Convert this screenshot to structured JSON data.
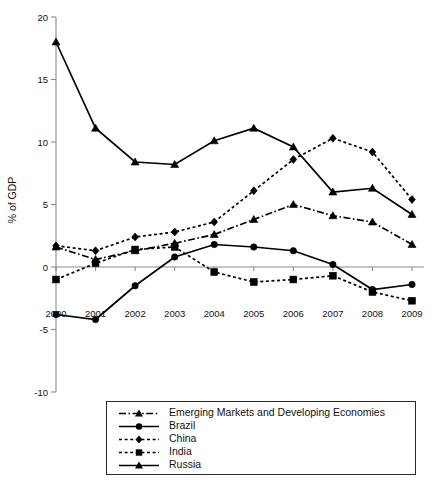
{
  "chart_data": {
    "type": "line",
    "title": "",
    "subtitle": "",
    "xlabel": "",
    "ylabel": "% of GDP",
    "x": [
      "2000",
      "2001",
      "2002",
      "2003",
      "2004",
      "2005",
      "2006",
      "2007",
      "2008",
      "2009"
    ],
    "categories": [
      "2000",
      "2001",
      "2002",
      "2003",
      "2004",
      "2005",
      "2006",
      "2007",
      "2008",
      "2009"
    ],
    "xlim": [
      "2000",
      "2009"
    ],
    "ylim": [
      -10,
      20
    ],
    "yticks": [
      -10,
      -5,
      0,
      5,
      10,
      15,
      20
    ],
    "ytick_labels": [
      "-10",
      "-5",
      "0",
      "5",
      "10",
      "15",
      "20"
    ],
    "grid": false,
    "zero_line": true,
    "legend_position": "bottom",
    "series": [
      {
        "name": "Emerging Markets and Developing Economies",
        "marker": "triangle",
        "line_style": "dash-dot",
        "values": [
          1.6,
          0.6,
          1.3,
          1.9,
          2.6,
          3.8,
          5.0,
          4.1,
          3.6,
          1.8
        ]
      },
      {
        "name": "Brazil",
        "marker": "circle",
        "line_style": "solid",
        "values": [
          -3.8,
          -4.2,
          -1.5,
          0.8,
          1.8,
          1.6,
          1.3,
          0.2,
          -1.8,
          -1.4
        ]
      },
      {
        "name": "China",
        "marker": "diamond",
        "line_style": "dotted",
        "values": [
          1.7,
          1.3,
          2.4,
          2.8,
          3.6,
          6.1,
          8.6,
          10.3,
          9.2,
          5.4
        ]
      },
      {
        "name": "India",
        "marker": "square",
        "line_style": "dotted",
        "values": [
          -1.0,
          0.3,
          1.4,
          1.6,
          -0.4,
          -1.2,
          -1.0,
          -0.7,
          -2.0,
          -2.7
        ]
      },
      {
        "name": "Russia",
        "marker": "triangle",
        "line_style": "solid",
        "values": [
          18.0,
          11.1,
          8.4,
          8.2,
          10.1,
          11.1,
          9.6,
          6.0,
          6.3,
          4.2
        ]
      }
    ]
  },
  "legend": {
    "items": [
      {
        "label": "Emerging Markets and Developing Economies",
        "marker": "triangle",
        "line_style": "dash-dot"
      },
      {
        "label": "Brazil",
        "marker": "circle",
        "line_style": "solid"
      },
      {
        "label": "China",
        "marker": "diamond",
        "line_style": "dotted"
      },
      {
        "label": "India",
        "marker": "square",
        "line_style": "dotted"
      },
      {
        "label": "Russia",
        "marker": "triangle",
        "line_style": "solid"
      }
    ]
  },
  "colors": {
    "series": "#000000",
    "axis": "#8a8a8a",
    "background": "#ffffff"
  }
}
